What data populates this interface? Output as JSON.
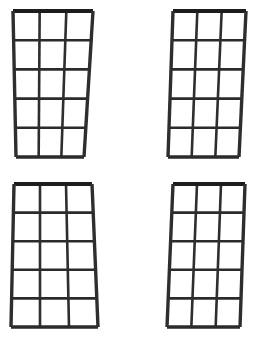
{
  "scene": {
    "title": "Window Grid Panels",
    "background_color": "#ffffff",
    "width": 265,
    "height": 337,
    "frame_color": "#262626",
    "pane_color": "#ffffff",
    "panel_count": 4,
    "arrangement": "2x2"
  },
  "panels": [
    {
      "id": "panel-top-left",
      "label": "Window Panel Top Left",
      "columns": 3,
      "rows": 5,
      "pane_count": 15,
      "shape": "trapezoid-narrow-bottom",
      "frame_color": "#262626",
      "geometry": {
        "top_left": [
          13,
          11
        ],
        "top_right": [
          93,
          11
        ],
        "bottom_left": [
          16,
          157
        ],
        "bottom_right": [
          84,
          157
        ],
        "top_width": 80,
        "bottom_width": 68,
        "height": 146,
        "stroke_width": 2.6,
        "outer_stroke_width": 3.4
      }
    },
    {
      "id": "panel-top-right",
      "label": "Window Panel Top Right",
      "columns": 3,
      "rows": 5,
      "pane_count": 15,
      "shape": "trapezoid-narrow-bottom",
      "frame_color": "#262626",
      "geometry": {
        "top_left": [
          173,
          11
        ],
        "top_right": [
          246,
          11
        ],
        "bottom_left": [
          168,
          157
        ],
        "bottom_right": [
          239,
          157
        ],
        "top_width": 73,
        "bottom_width": 71,
        "height": 146,
        "stroke_width": 2.6,
        "outer_stroke_width": 3.4
      }
    },
    {
      "id": "panel-bottom-left",
      "label": "Window Panel Bottom Left",
      "columns": 3,
      "rows": 5,
      "pane_count": 15,
      "shape": "trapezoid-wide-bottom",
      "frame_color": "#262626",
      "geometry": {
        "top_left": [
          14,
          184
        ],
        "top_right": [
          92,
          184
        ],
        "bottom_left": [
          11,
          327
        ],
        "bottom_right": [
          98,
          327
        ],
        "top_width": 78,
        "bottom_width": 87,
        "height": 143,
        "stroke_width": 2.6,
        "outer_stroke_width": 3.4
      }
    },
    {
      "id": "panel-bottom-right",
      "label": "Window Panel Bottom Right",
      "columns": 3,
      "rows": 5,
      "pane_count": 15,
      "shape": "trapezoid-narrow-bottom",
      "frame_color": "#262626",
      "geometry": {
        "top_left": [
          173,
          184
        ],
        "top_right": [
          245,
          184
        ],
        "bottom_left": [
          167,
          327
        ],
        "bottom_right": [
          240,
          327
        ],
        "top_width": 72,
        "bottom_width": 73,
        "height": 143,
        "stroke_width": 2.6,
        "outer_stroke_width": 3.4
      }
    }
  ]
}
